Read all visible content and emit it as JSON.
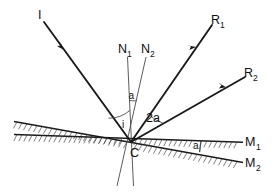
{
  "figure": {
    "background_color": "#ffffff",
    "line_color": "#1a1a1a",
    "hatch_color": "#3a3a3a",
    "normal_color": "#4a4a4a"
  },
  "labels": {
    "incident_ray": "I",
    "reflected_ray_1_base": "R",
    "reflected_ray_1_sub": "1",
    "reflected_ray_2_base": "R",
    "reflected_ray_2_sub": "2",
    "normal_1_base": "N",
    "normal_1_sub": "1",
    "normal_2_base": "N",
    "normal_2_sub": "2",
    "mirror_1_base": "M",
    "mirror_1_sub": "1",
    "mirror_2_base": "M",
    "mirror_2_sub": "2",
    "vertex": "C",
    "angle_of_incidence": "i",
    "angle_between_normals": "a",
    "angle_between_reflected_rays": "2a",
    "angle_between_mirrors": "a"
  },
  "geometry": {
    "vertex_point": "C",
    "mirror_1_description": "horizontal mirror through C",
    "mirror_2_description": "mirror inclined at angle a to M1 through C",
    "normals_note": "N1 perpendicular to M1, N2 perpendicular to M2",
    "relation": "angle between reflected rays R1 and R2 equals 2a"
  }
}
